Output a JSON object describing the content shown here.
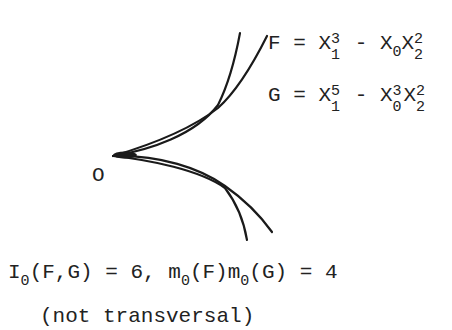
{
  "figure": {
    "origin_label": "O",
    "eq_F": {
      "lhs": "F",
      "rhs": "= X₁³ - X₀X₂²"
    },
    "eq_G": {
      "lhs": "G",
      "rhs": "= X₁⁵ - X₀³X₂²"
    },
    "caption_line1": "I0(F,G) = 6, m0(F)m0(G) = 4",
    "caption_line2": "(not transversal)"
  },
  "text": {
    "F": "F",
    "eq": "=",
    "X": "X",
    "minus": "-",
    "n0": "0",
    "n1": "1",
    "n2": "2",
    "n3": "3",
    "n5": "5",
    "I": "I",
    "fg": "(F,G) = 6,",
    "m": "m",
    "pF": "(F)",
    "pG": "(G) = 4",
    "not_transversal": "(not transversal)",
    "G": "G",
    "O": "O"
  }
}
